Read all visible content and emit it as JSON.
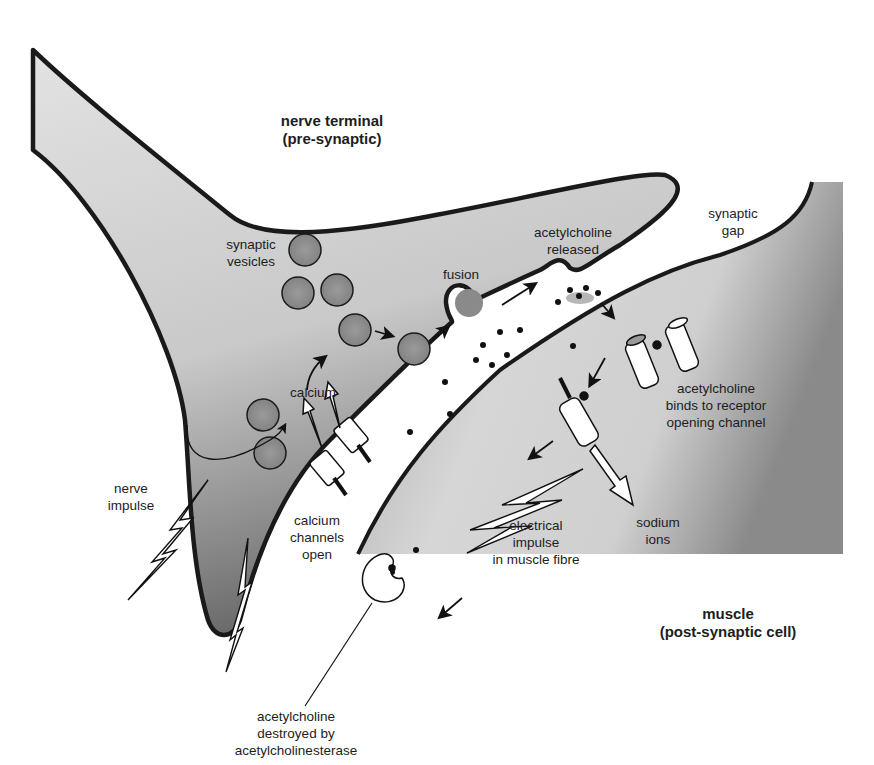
{
  "diagram": {
    "type": "neuromuscular junction / synapse schematic",
    "colors": {
      "background": "#ffffff",
      "membrane": "#1a1a1a",
      "cytoplasm_light": "#d6d6d6",
      "cytoplasm_dark": "#6e6e6e",
      "vesicle": "#8f8f8f",
      "text": "#1d1d1d"
    },
    "regions": {
      "nerve_terminal": {
        "line1": "nerve terminal",
        "line2": "(pre-synaptic)"
      },
      "muscle": {
        "line1": "muscle",
        "line2": "(post-synaptic cell)"
      },
      "synaptic_gap": {
        "line1": "synaptic",
        "line2": "gap"
      }
    },
    "labels": {
      "synaptic_vesicles": {
        "line1": "synaptic",
        "line2": "vesicles"
      },
      "fusion": {
        "line1": "fusion"
      },
      "ach_released": {
        "line1": "acetylcholine",
        "line2": "released"
      },
      "calcium": {
        "line1": "calcium"
      },
      "nerve_impulse": {
        "line1": "nerve",
        "line2": "impulse"
      },
      "calcium_channels": {
        "line1": "calcium",
        "line2": "channels",
        "line3": "open"
      },
      "ach_binds": {
        "line1": "acetylcholine",
        "line2": "binds to receptor",
        "line3": "opening channel"
      },
      "sodium_ions": {
        "line1": "sodium",
        "line2": "ions"
      },
      "electrical_impulse": {
        "line1": "electrical",
        "line2": "impulse",
        "line3": "in muscle fibre"
      },
      "ach_destroyed": {
        "line1": "acetylcholine",
        "line2": "destroyed by",
        "line3": "acetylcholinesterase"
      }
    }
  }
}
